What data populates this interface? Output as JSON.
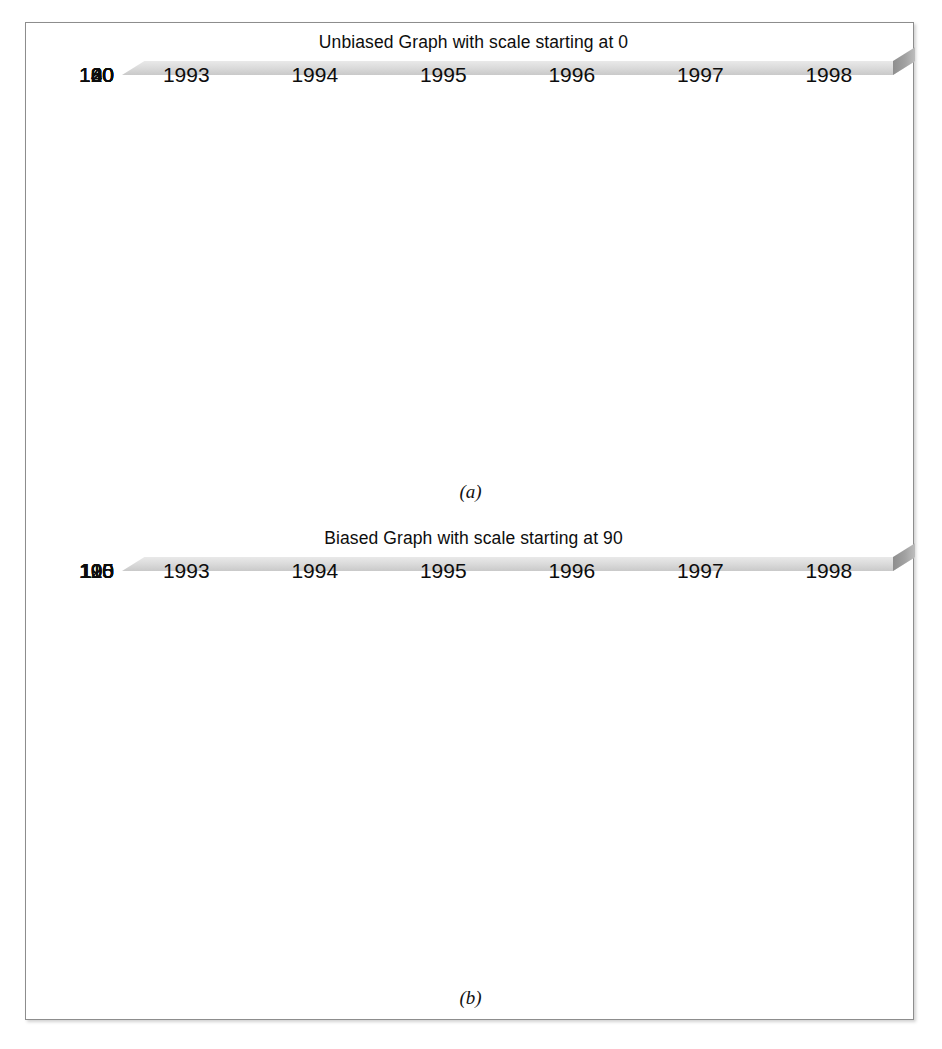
{
  "figure": {
    "charts": [
      {
        "id": "a",
        "title": "Unbiased Graph with scale starting at 0",
        "caption": "(a)",
        "y_ticks": [
          "140",
          "120",
          "100",
          "80",
          "60",
          "40",
          "20",
          "0"
        ],
        "x_ticks": [
          "1993",
          "1994",
          "1995",
          "1996",
          "1997",
          "1998"
        ]
      },
      {
        "id": "b",
        "title": "Biased Graph with scale starting at 90",
        "caption": "(b)",
        "y_ticks": [
          "120",
          "115",
          "110",
          "105",
          "100",
          "95",
          "90"
        ],
        "x_ticks": [
          "1993",
          "1994",
          "1995",
          "1996",
          "1997",
          "1998"
        ]
      }
    ],
    "colors": {
      "bar": "#484849",
      "plot_background": "#b6b6b6",
      "gridline": "#f0f0f0",
      "page_background": "#ffffff",
      "frame_border": "#8d8d8d"
    }
  },
  "chart_data": [
    {
      "type": "bar",
      "id": "a",
      "title": "Unbiased Graph with scale starting at 0",
      "caption": "(a)",
      "categories": [
        "1993",
        "1994",
        "1995",
        "1996",
        "1997",
        "1998"
      ],
      "values": [
        100.2,
        104.3,
        105.3,
        108.5,
        105.5,
        115.5
      ],
      "xlabel": "",
      "ylabel": "",
      "ylim": [
        0,
        140
      ],
      "ytick_step": 20,
      "yticks": [
        0,
        20,
        40,
        60,
        80,
        100,
        120,
        140
      ],
      "grid": true,
      "legend": false,
      "style": "3d-plate"
    },
    {
      "type": "bar",
      "id": "b",
      "title": "Biased Graph with scale starting at 90",
      "caption": "(b)",
      "categories": [
        "1993",
        "1994",
        "1995",
        "1996",
        "1997",
        "1998"
      ],
      "values": [
        100.2,
        104.3,
        105.3,
        107.3,
        104.4,
        115.4
      ],
      "xlabel": "",
      "ylabel": "",
      "ylim": [
        90,
        120
      ],
      "ytick_step": 5,
      "yticks": [
        90,
        95,
        100,
        105,
        110,
        115,
        120
      ],
      "grid": true,
      "legend": false,
      "style": "3d-plate"
    }
  ]
}
